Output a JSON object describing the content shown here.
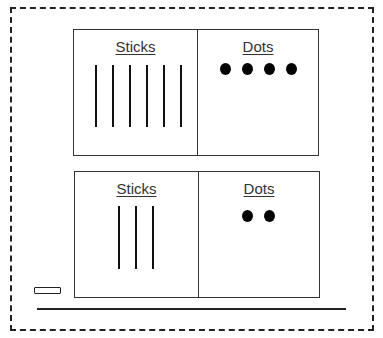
{
  "diagram": {
    "tables": [
      {
        "name": "top",
        "left_header": "Sticks",
        "right_header": "Dots",
        "sticks_count": 6,
        "dots_count": 4
      },
      {
        "name": "bottom",
        "left_header": "Sticks",
        "right_header": "Dots",
        "sticks_count": 3,
        "dots_count": 2
      }
    ],
    "colors": {
      "line": "#222222",
      "dot": "#000000",
      "text": "#333333"
    }
  }
}
